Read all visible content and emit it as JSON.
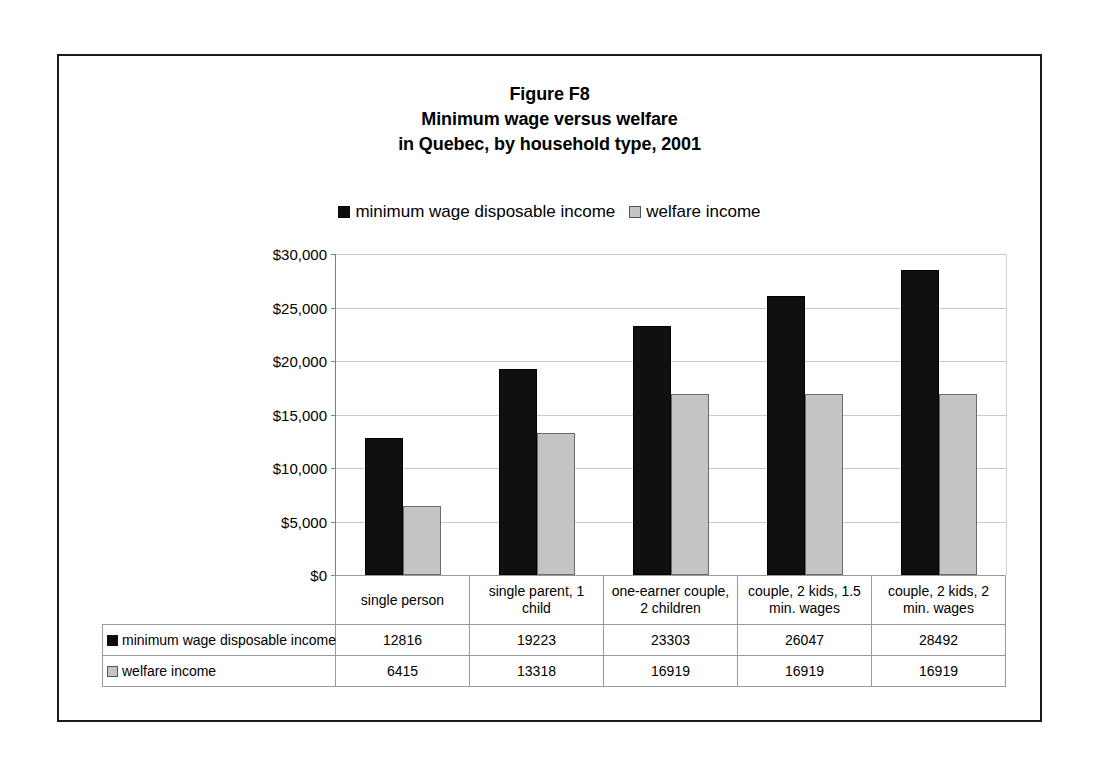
{
  "figure": {
    "title_lines": [
      "Figure F8",
      "Minimum wage versus welfare",
      "in Quebec, by household type, 2001"
    ]
  },
  "legend": {
    "entries": [
      {
        "label": "minimum wage disposable income",
        "swatch": "black-square-icon",
        "color": "#0d0d0d"
      },
      {
        "label": "welfare income",
        "swatch": "gray-square-icon",
        "color": "#c4c4c4"
      }
    ]
  },
  "axis": {
    "yticks": [
      "$0",
      "$5,000",
      "$10,000",
      "$15,000",
      "$20,000",
      "$25,000",
      "$30,000"
    ]
  },
  "table": {
    "row_keys": [
      "minimum wage disposable income",
      "welfare income"
    ],
    "rows": [
      [
        "12816",
        "19223",
        "23303",
        "26047",
        "28492"
      ],
      [
        "6415",
        "13318",
        "16919",
        "16919",
        "16919"
      ]
    ]
  },
  "chart_data": {
    "type": "bar",
    "title": "Figure F8 Minimum wage versus welfare in Quebec, by household type, 2001",
    "xlabel": "",
    "ylabel": "",
    "ylim": [
      0,
      30000
    ],
    "ytick_step": 5000,
    "grid": true,
    "legend_position": "top-center",
    "categories": [
      "single person",
      "single parent, 1 child",
      "one-earner couple, 2 children",
      "couple, 2 kids, 1.5 min. wages",
      "couple, 2 kids, 2 min. wages"
    ],
    "series": [
      {
        "name": "minimum wage disposable income",
        "color": "#0d0d0d",
        "values": [
          12816,
          19223,
          23303,
          26047,
          28492
        ]
      },
      {
        "name": "welfare income",
        "color": "#c4c4c4",
        "values": [
          6415,
          13318,
          16919,
          16919,
          16919
        ]
      }
    ]
  }
}
